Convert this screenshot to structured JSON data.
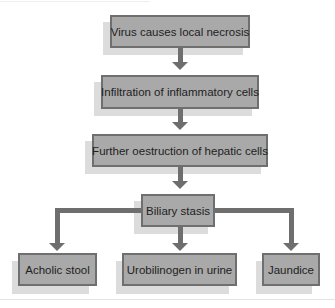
{
  "diagram": {
    "type": "flowchart",
    "colors": {
      "box_fill": "#a9a9a9",
      "box_border": "#6f6f6f",
      "arrow": "#6e6e6e",
      "shadow": "#dcdcdc",
      "text": "#1e1e1e"
    },
    "nodes": [
      {
        "id": "n1",
        "label": "Virus causes local necrosis"
      },
      {
        "id": "n2",
        "label": "Infiltration of inflammatory cells"
      },
      {
        "id": "n3",
        "label": "Further oestruction of hepatic cells"
      },
      {
        "id": "n4",
        "label": "Biliary stasis"
      },
      {
        "id": "n5",
        "label": "Acholic stool"
      },
      {
        "id": "n6",
        "label": "Urobilinogen in urine"
      },
      {
        "id": "n7",
        "label": "Jaundice"
      }
    ],
    "edges": [
      {
        "from": "n1",
        "to": "n2"
      },
      {
        "from": "n2",
        "to": "n3"
      },
      {
        "from": "n3",
        "to": "n4"
      },
      {
        "from": "n4",
        "to": "n5"
      },
      {
        "from": "n4",
        "to": "n6"
      },
      {
        "from": "n4",
        "to": "n7"
      }
    ]
  }
}
